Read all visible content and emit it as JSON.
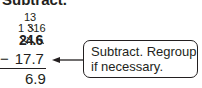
{
  "heading": "Subtract.",
  "regrouping": {
    "carry_top": "13",
    "carry_mid_left": "1",
    "carry_mid_struck": "3",
    "carry_mid_right": "16"
  },
  "problem": {
    "top_digits": [
      "2",
      "4",
      ".",
      "6"
    ],
    "operator": "−",
    "subtrahend": "17.7",
    "answer": "6.9"
  },
  "callout": {
    "line1": "Subtract. Regroup",
    "line2": "if necessary."
  },
  "colors": {
    "ink": "#231f20",
    "background": "#ffffff"
  }
}
